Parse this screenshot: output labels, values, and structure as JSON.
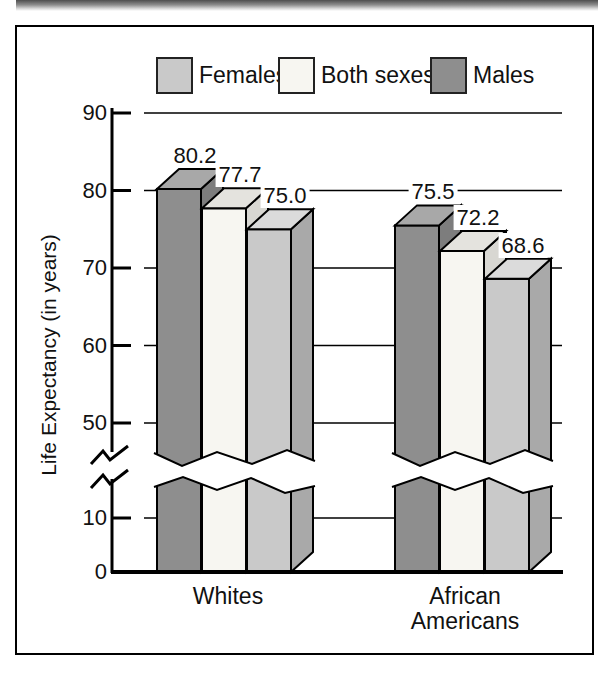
{
  "figure": {
    "kind": "textbook-bar-chart",
    "frame_border_color": "#000000",
    "background": "#ffffff"
  },
  "chart_data": {
    "type": "bar",
    "title": "",
    "xlabel": "",
    "ylabel": "Life Expectancy (in years)",
    "categories": [
      "Whites",
      "African Americans"
    ],
    "categories_lines": [
      [
        "Whites"
      ],
      [
        "African",
        "Americans"
      ]
    ],
    "legend": [
      {
        "label": "Females",
        "color": "#c9c9c9"
      },
      {
        "label": "Both sexes",
        "color": "#f7f6f1"
      },
      {
        "label": "Males",
        "color": "#8e8e8e"
      }
    ],
    "legend_position": "top",
    "bar_order_note": "bars left-to-right in each group: dark, white, light gray",
    "series": [
      {
        "name": "Males",
        "color": "#8e8e8e",
        "top_color": "#a8a8a8",
        "side_color": "#7d7d7d",
        "values": [
          80.2,
          75.5
        ],
        "labels": [
          "80.2",
          "75.5"
        ]
      },
      {
        "name": "Both sexes",
        "color": "#f7f6f1",
        "top_color": "#e4e3de",
        "side_color": "#d8d7d2",
        "values": [
          77.7,
          72.2
        ],
        "labels": [
          "77.7",
          "72.2"
        ]
      },
      {
        "name": "Females",
        "color": "#c9c9c9",
        "top_color": "#dbdbdb",
        "side_color": "#a9a9a9",
        "values": [
          75.0,
          68.6
        ],
        "labels": [
          "75.0",
          "68.6"
        ]
      }
    ],
    "axis": {
      "yticks": [
        90,
        80,
        70,
        60,
        50,
        10,
        0
      ],
      "ytick_labels": [
        "90",
        "80",
        "70",
        "60",
        "50",
        "10",
        "0"
      ],
      "ylim": [
        0,
        90
      ],
      "broken_axis": true,
      "break_between": [
        10,
        50
      ],
      "grid": true,
      "grid_color": "#000000"
    },
    "effects": {
      "style": "3d-bars",
      "value_labels_shown": true
    }
  }
}
